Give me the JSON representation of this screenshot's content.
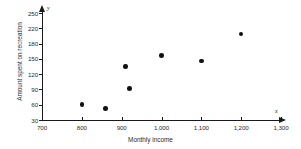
{
  "chart_data": {
    "type": "scatter",
    "title": "",
    "xlabel": "Monthly income",
    "ylabel": "Amount spent on recreation",
    "xlim": [
      700,
      1300
    ],
    "ylim": [
      30,
      250
    ],
    "grid": false,
    "legend": "none",
    "x_axis_letter": "x",
    "y_axis_letter": "y",
    "xticks": [
      700,
      800,
      900,
      1000,
      1100,
      1200,
      1300
    ],
    "xtick_labels": [
      "700",
      "800",
      "900",
      "1,000",
      "1,100",
      "1,200",
      "1,300"
    ],
    "yticks": [
      30,
      60,
      90,
      120,
      150,
      180,
      220,
      250
    ],
    "ytick_labels": [
      "30",
      "60",
      "90",
      "120",
      "150",
      "180",
      "220",
      "250"
    ],
    "points": [
      {
        "x": 800,
        "y": 60,
        "label": "point-1"
      },
      {
        "x": 860,
        "y": 52,
        "label": "point-2"
      },
      {
        "x": 910,
        "y": 135,
        "label": "point-3"
      },
      {
        "x": 920,
        "y": 92,
        "label": "point-4"
      },
      {
        "x": 1000,
        "y": 157,
        "label": "point-5"
      },
      {
        "x": 1100,
        "y": 146,
        "label": "point-6"
      },
      {
        "x": 1200,
        "y": 205,
        "label": "point-7"
      }
    ],
    "marker_color": "#111111",
    "axis_color": "#1a1a1a"
  }
}
